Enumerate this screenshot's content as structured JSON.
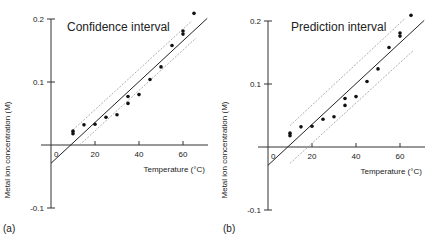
{
  "figure": {
    "panels": [
      {
        "id": "a",
        "tag": "(a)",
        "title": "Confidence interval",
        "xlabel": "Temperature (°C)",
        "ylabel": "Metal ion concentration (M)",
        "origin_label": "0"
      },
      {
        "id": "b",
        "tag": "(b)",
        "title": "Prediction interval",
        "xlabel": "Temperature (°C)",
        "ylabel": "Metal ion concentration (M)",
        "origin_label": "0"
      }
    ]
  },
  "chart_data": [
    {
      "type": "scatter",
      "title": "Confidence interval",
      "panel_tag": "(a)",
      "xlabel": "Temperature (°C)",
      "ylabel": "Metal ion concentration (M)",
      "xlim": [
        0,
        72
      ],
      "ylim": [
        -0.1,
        0.2
      ],
      "xticks": [
        20,
        40,
        60
      ],
      "yticks": [
        -0.1,
        0.1,
        0.2
      ],
      "ytick_labels": [
        "-0.1",
        "0.1",
        "0.2"
      ],
      "xtick_labels": [
        "20",
        "40",
        "60"
      ],
      "grid": false,
      "legend": null,
      "points": {
        "x": [
          10,
          10,
          15,
          20,
          25,
          30,
          35,
          35,
          40,
          45,
          50,
          55,
          60,
          60,
          65
        ],
        "y": [
          0.018,
          0.022,
          0.032,
          0.033,
          0.044,
          0.048,
          0.066,
          0.077,
          0.08,
          0.104,
          0.124,
          0.158,
          0.176,
          0.181,
          0.209
        ]
      },
      "fit_line": {
        "x": [
          0,
          71
        ],
        "y": [
          -0.029,
          0.201
        ],
        "style": "solid"
      },
      "band": {
        "type": "confidence",
        "style": "dotted",
        "upper": {
          "x": [
            10,
            64
          ],
          "y": [
            0.024,
            0.197
          ]
        },
        "lower": {
          "x": [
            13,
            66
          ],
          "y": [
            0.0,
            0.17
          ]
        }
      }
    },
    {
      "type": "scatter",
      "title": "Prediction interval",
      "panel_tag": "(b)",
      "xlabel": "Temperature (°C)",
      "ylabel": "Metal ion concentration (M)",
      "xlim": [
        0,
        72
      ],
      "ylim": [
        -0.1,
        0.2
      ],
      "xticks": [
        20,
        40,
        60
      ],
      "yticks": [
        -0.1,
        0.1,
        0.2
      ],
      "ytick_labels": [
        "-0.1",
        "0.1",
        "0.2"
      ],
      "xtick_labels": [
        "20",
        "40",
        "60"
      ],
      "grid": false,
      "legend": null,
      "points": {
        "x": [
          10,
          10,
          15,
          20,
          25,
          30,
          35,
          35,
          40,
          45,
          50,
          55,
          60,
          60,
          65
        ],
        "y": [
          0.018,
          0.022,
          0.032,
          0.033,
          0.044,
          0.048,
          0.066,
          0.077,
          0.08,
          0.104,
          0.124,
          0.158,
          0.176,
          0.181,
          0.209
        ]
      },
      "fit_line": {
        "x": [
          0,
          71
        ],
        "y": [
          -0.029,
          0.201
        ],
        "style": "solid"
      },
      "band": {
        "type": "prediction",
        "style": "dotted",
        "upper": {
          "x": [
            10,
            62
          ],
          "y": [
            0.034,
            0.203
          ]
        },
        "lower": {
          "x": [
            10,
            66
          ],
          "y": [
            -0.026,
            0.153
          ]
        }
      }
    }
  ],
  "layout": {
    "panels": [
      {
        "x0": 51,
        "xs": 2.2,
        "y0": 145,
        "ys": 630,
        "xaxis_end": 208,
        "title_x": 67,
        "title_y": 31,
        "tag_x": 3,
        "tag_y": 232,
        "ylabel_x": 10,
        "ylabel_y": 150
      },
      {
        "x0": 268,
        "xs": 2.2,
        "y0": 147,
        "ys": 630,
        "xaxis_end": 425,
        "title_x": 291,
        "title_y": 31,
        "tag_x": 223,
        "tag_y": 232,
        "ylabel_x": 227,
        "ylabel_y": 150
      }
    ]
  }
}
